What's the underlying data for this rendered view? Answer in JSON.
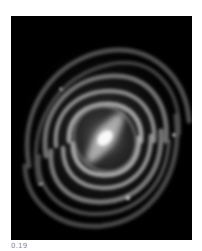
{
  "image": {
    "subject": "spiral galaxy",
    "description": "Grayscale barred spiral galaxy with bright central bar and multiple wound arms on black background",
    "background_color": "#000000",
    "core_color": "#ffffff"
  },
  "caption": {
    "text": "0.19"
  }
}
